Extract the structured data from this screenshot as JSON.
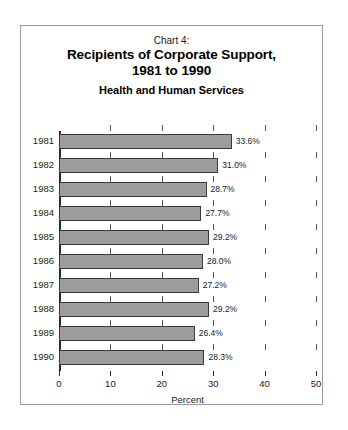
{
  "figure": {
    "chart_label": "Chart 4:",
    "title_line1": "Recipients of Corporate Support,",
    "title_line2": "1981 to 1990",
    "subtitle": "Health and Human Services"
  },
  "chart_data": {
    "type": "bar",
    "orientation": "horizontal",
    "title": "Chart 4: Recipients of Corporate Support, 1981 to 1990",
    "subtitle": "Health and Human Services",
    "categories": [
      "1981",
      "1982",
      "1983",
      "1984",
      "1985",
      "1986",
      "1987",
      "1988",
      "1989",
      "1990"
    ],
    "values": [
      33.6,
      31.0,
      28.7,
      27.7,
      29.2,
      28.0,
      27.2,
      29.2,
      26.4,
      28.3
    ],
    "value_labels": [
      "33.6%",
      "31.0%",
      "28.7%",
      "27.7%",
      "29.2%",
      "28.0%",
      "27.2%",
      "29.2%",
      "26.4%",
      "28.3%"
    ],
    "xlabel": "Percent",
    "ylabel": "",
    "xlim": [
      0,
      50
    ],
    "xticks": [
      0,
      10,
      20,
      30,
      40,
      50
    ],
    "xtick_labels": [
      "0",
      "10",
      "20",
      "30",
      "40",
      "50"
    ],
    "grid": false,
    "legend": null,
    "bar_color": "#9c9c9c",
    "bar_edge_color": "#3a3a3a"
  }
}
